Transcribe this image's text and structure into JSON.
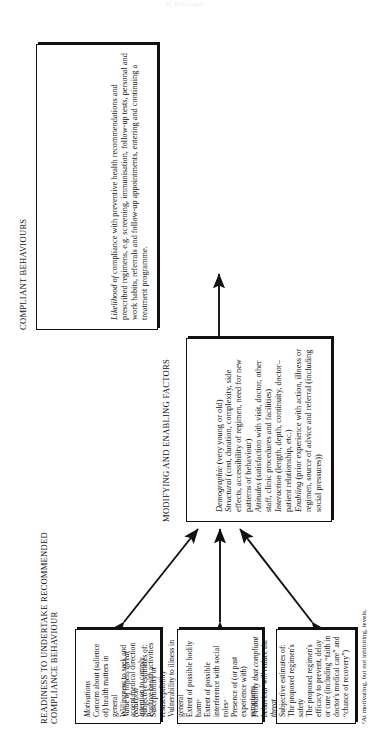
{
  "page": {
    "running_head": "H. Bruce and"
  },
  "figure": {
    "compliant": {
      "caption": "COMPLIANT BEHAVIOURS",
      "lead_italic": "Likelihood of",
      "body": "compliance with preventive health recommendations and prescribed regimens, e.g. screening, immunisation, follow-up tests, personal and work habits, referrals and follow-up appointments, entering and continuing a treatment programme."
    },
    "modifying": {
      "caption": "MODIFYING AND ENABLING FACTORS",
      "items": [
        {
          "term": "Demographic",
          "text": " (very young or old)"
        },
        {
          "term": "Structural",
          "text": " (cost, duration, complexity, side effects, accessibility of regimen, need for new patterns of behaviour)"
        },
        {
          "term": "Attitudes",
          "text": " (satisfaction with visit, doctor, other staff, clinic procedures and facilities)"
        },
        {
          "term": "Interaction",
          "text": " (length, depth, continuity, doctor–patient relationship, etc.)"
        },
        {
          "term": "Enabling",
          "text": " (prior experience with action, illness or regimen, source of advice and referral (including social pressures))"
        }
      ]
    },
    "readiness": {
      "caption": "READINESS TO UNDERTAKE RECOMMENDED COMPLIANCE BEHAVIOUR",
      "boxes": [
        {
          "heading": "Motivations",
          "lines": [
            "Concern about (salience of) health matters in general",
            "Willingness to seek and accept medical direction",
            "Intention to comply",
            "Positive health activities"
          ]
        },
        {
          "heading": "Value of illness threat reduction",
          "lines": [
            "Subjective estimates of:",
            "Susceptibility or resusceptibility",
            "Vulnerability to illness in general",
            "Extent of possible bodily harmᵃ",
            "Extent of possible interference with social rolesᵃ",
            "Presence of (or past experience with) symptoms"
          ]
        },
        {
          "heading": "Probability that compliant behaviour will reduce the threat",
          "lines": [
            "Subjective estimates of:",
            "The proposed regimen's safety",
            "The proposed regimen's efficacy to prevent, delay or cure (including “faith in doctor's medical care” and “chance of recovery”)"
          ]
        }
      ]
    },
    "footnote": "ᵃAt motivating, but not inhibiting, levels."
  }
}
